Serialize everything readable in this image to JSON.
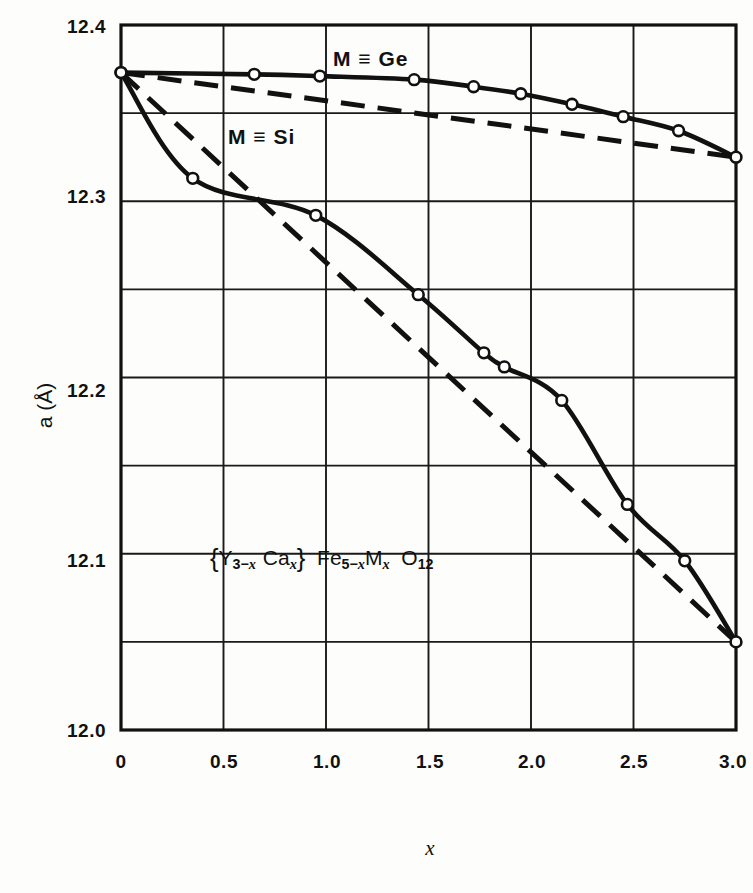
{
  "figure": {
    "background_color": "#fdfdfb",
    "ink_color": "#111111"
  },
  "axes": {
    "y": {
      "label": "a (Å)",
      "label_symbol": "a",
      "label_unit": "(Å)",
      "ticks": [
        "12.0",
        "12.1",
        "12.2",
        "12.3",
        "12.4"
      ],
      "tick_values": [
        12.0,
        12.1,
        12.2,
        12.3,
        12.4
      ],
      "min": 12.0,
      "max": 12.4,
      "minor_step": 0.05
    },
    "x": {
      "label": "x",
      "ticks": [
        "0",
        "0.5",
        "1.0",
        "1.5",
        "2.0",
        "2.5",
        "3.0"
      ],
      "tick_values": [
        0,
        0.5,
        1.0,
        1.5,
        2.0,
        2.5,
        3.0
      ],
      "min": 0,
      "max": 3.0,
      "minor_step": 0.5
    },
    "grid": "on"
  },
  "annotations": {
    "ge_label": "M ≡ Ge",
    "si_label": "M ≡ Si",
    "formula_plain": "{Y3-x Cax} Fe5-x Mx O12",
    "formula_parts": {
      "open_brace": "{",
      "y": "Y",
      "y_sub_num": "3−",
      "y_sub_var": "x",
      "ca": "Ca",
      "ca_sub_var": "x",
      "close_brace": "}",
      "fe": "Fe",
      "fe_sub_num": "5−",
      "fe_sub_var": "x",
      "m": "M",
      "m_sub_var": "x",
      "o": "O",
      "o_sub": "12"
    }
  },
  "chart_data": {
    "type": "line",
    "title": "",
    "subtitle": "",
    "xlabel": "x",
    "ylabel": "a (Å)",
    "xlim": [
      0,
      3.0
    ],
    "ylim": [
      12.0,
      12.4
    ],
    "grid": true,
    "legend": "inline-annotations",
    "series": [
      {
        "name": "M ≡ Ge",
        "style": "solid-with-open-circles",
        "marker": "open-circle",
        "x": [
          0.0,
          0.65,
          0.97,
          1.43,
          1.72,
          1.95,
          2.2,
          2.45,
          2.72,
          3.0
        ],
        "y": [
          12.373,
          12.372,
          12.371,
          12.369,
          12.365,
          12.361,
          12.355,
          12.348,
          12.34,
          12.325
        ]
      },
      {
        "name": "M ≡ Ge (Vegard reference)",
        "style": "dashed",
        "marker": "none",
        "x": [
          0.0,
          3.0
        ],
        "y": [
          12.373,
          12.325
        ]
      },
      {
        "name": "M ≡ Si",
        "style": "solid-with-open-circles",
        "marker": "open-circle",
        "x": [
          0.0,
          0.35,
          0.95,
          1.45,
          1.77,
          1.87,
          2.15,
          2.47,
          2.75,
          3.0
        ],
        "y": [
          12.373,
          12.313,
          12.292,
          12.247,
          12.214,
          12.206,
          12.187,
          12.128,
          12.096,
          12.05
        ]
      },
      {
        "name": "M ≡ Si (Vegard reference)",
        "style": "dashed",
        "marker": "none",
        "x": [
          0.0,
          3.0
        ],
        "y": [
          12.373,
          12.05
        ]
      }
    ]
  }
}
